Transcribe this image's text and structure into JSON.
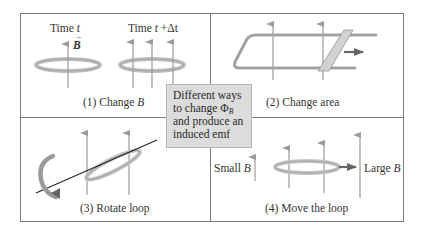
{
  "center_box": {
    "lines": [
      "Different ways",
      "to change Φ",
      "and produce an",
      "induced emf"
    ],
    "flux_subscript": "B"
  },
  "panels": [
    {
      "id": 1,
      "caption_prefix": "(1) Change ",
      "caption_var": "B",
      "labels": {
        "time_t_prefix": "Time ",
        "time_t_var": "t",
        "time_t2_prefix": "Time ",
        "time_t2_var": "t",
        "time_t2_suffix": " +Δt",
        "field_vector": "B"
      }
    },
    {
      "id": 2,
      "caption": "(2) Change area"
    },
    {
      "id": 3,
      "caption": "(3) Rotate loop"
    },
    {
      "id": 4,
      "caption": "(4) Move the loop",
      "labels": {
        "small_prefix": "Small ",
        "small_var": "B",
        "large_prefix": "Large ",
        "large_var": "B"
      }
    }
  ],
  "colors": {
    "frame": "#7a7a7a",
    "field_arrow": "#9a9a9a",
    "loop": "#bdbdbd",
    "center_box_bg": "#dcdcdc",
    "motion_arrow": "#666666"
  }
}
